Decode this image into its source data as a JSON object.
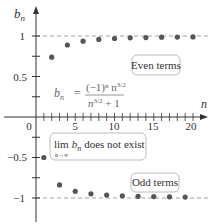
{
  "chart_data": {
    "type": "scatter",
    "title": "",
    "xlabel": "n",
    "ylabel": "b_n",
    "xlim": [
      0,
      21
    ],
    "ylim": [
      -1.2,
      1.2
    ],
    "x_ticks": [
      0,
      5,
      10,
      15,
      20
    ],
    "x_tick_labels": [
      "0",
      "5",
      "10",
      "15",
      "20"
    ],
    "y_tick_labels": [
      "1",
      "0.5",
      "-0.5",
      "-1"
    ],
    "y_ticks": [
      1,
      0.75,
      0.5,
      0.25,
      -0.25,
      -0.5,
      -0.75,
      -1
    ],
    "reference_lines": [
      1,
      -1
    ],
    "grid": false,
    "formula": "b_n = (-1)^n n^{3/2} / (n^{3/2} + 1)",
    "annotations": [
      "Even terms",
      "Odd terms",
      "lim b_n does not exist (n→∞)"
    ],
    "series": [
      {
        "name": "Even terms",
        "x": [
          2,
          4,
          6,
          8,
          10,
          12,
          14,
          16,
          18,
          20
        ],
        "values": [
          0.739,
          0.889,
          0.936,
          0.958,
          0.969,
          0.977,
          0.981,
          0.985,
          0.987,
          0.989
        ]
      },
      {
        "name": "Odd terms",
        "x": [
          1,
          3,
          5,
          7,
          9,
          11,
          13,
          15,
          17,
          19
        ],
        "values": [
          -0.5,
          -0.839,
          -0.918,
          -0.949,
          -0.964,
          -0.973,
          -0.979,
          -0.983,
          -0.986,
          -0.988
        ]
      }
    ]
  },
  "labels": {
    "y_axis": "b",
    "y_axis_sub": "n",
    "x_axis": "n",
    "even_box": "Even terms",
    "odd_box": "Odd terms",
    "lim_main": "lim",
    "lim_b": "b",
    "lim_sub_n": "n",
    "lim_under": "n→∞",
    "lim_rest": "does not exist",
    "formula_b": "b",
    "formula_sub": "n",
    "formula_eq": "=",
    "formula_num": "(−1)ⁿ n",
    "formula_num_exp": "3/2",
    "formula_den": "n",
    "formula_den_exp": "3/2",
    "formula_den_rest": " + 1",
    "tick_y_1": "1",
    "tick_y_05": "0.5",
    "tick_y_m05": "−0.5",
    "tick_y_m1": "−1",
    "tick_x_0": "0",
    "tick_x_5": "5",
    "tick_x_10": "10",
    "tick_x_15": "15",
    "tick_x_20": "20"
  },
  "colors": {
    "axis": "#333333",
    "points": "#555555",
    "dashed": "#888888",
    "box_border": "#aaaaaa"
  }
}
